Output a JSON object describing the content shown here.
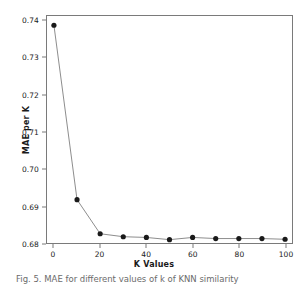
{
  "chart_data": {
    "type": "line",
    "title": "",
    "xlabel": "K Values",
    "ylabel": "MAE per K",
    "x": [
      0,
      10,
      20,
      30,
      40,
      50,
      60,
      70,
      80,
      90,
      100
    ],
    "values": [
      0.7388,
      0.6917,
      0.6825,
      0.6817,
      0.6815,
      0.6809,
      0.6815,
      0.6812,
      0.6812,
      0.6812,
      0.681
    ],
    "series": [
      {
        "name": "MAE per K",
        "values": [
          0.7388,
          0.6917,
          0.6825,
          0.6817,
          0.6815,
          0.6809,
          0.6815,
          0.6812,
          0.6812,
          0.6812,
          0.681
        ]
      }
    ],
    "xlim": [
      -3,
      103
    ],
    "ylim": [
      0.68,
      0.7413
    ],
    "xticks": [
      0,
      20,
      40,
      60,
      80,
      100
    ],
    "xtick_labels": [
      "0",
      "20",
      "40",
      "60",
      "80",
      "100"
    ],
    "yticks": [
      0.68,
      0.69,
      0.7,
      0.71,
      0.72,
      0.73,
      0.74
    ],
    "ytick_labels": [
      "0.68",
      "0.69",
      "0.70",
      "0.71",
      "0.72",
      "0.73",
      "0.74"
    ],
    "grid": false,
    "legend": "none",
    "marker": "circle",
    "marker_color": "#1a1a1a",
    "line_color": "#8c8c8c",
    "frame_color": "#7a7a7a"
  },
  "caption": {
    "text": "Fig. 5. MAE for different values of k of KNN similarity"
  }
}
